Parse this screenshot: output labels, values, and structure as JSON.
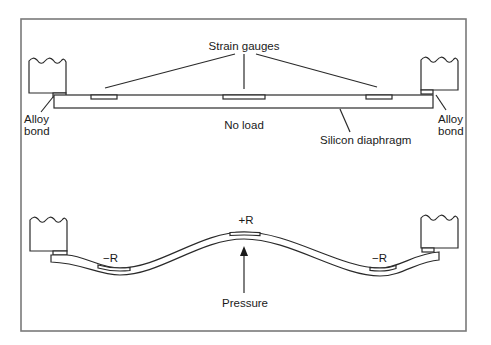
{
  "diagram": {
    "top_panel": {
      "title_label": "Strain gauges",
      "state_label": "No load",
      "diaphragm_label": "Silicon diaphragm",
      "left_bond_label_line1": "Alloy",
      "left_bond_label_line2": "bond",
      "right_bond_label_line1": "Alloy",
      "right_bond_label_line2": "bond"
    },
    "bottom_panel": {
      "left_gauge_label": "−R",
      "center_gauge_label": "+R",
      "right_gauge_label": "−R",
      "force_label": "Pressure"
    },
    "colors": {
      "line": "#2a2a2a",
      "frame": "#7a7a7a",
      "background": "#ffffff"
    }
  }
}
